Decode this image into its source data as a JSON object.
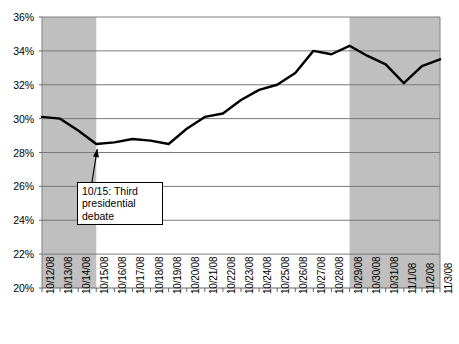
{
  "chart_data": {
    "type": "line",
    "title": "",
    "subtitle": "",
    "xlabel": "",
    "ylabel": "",
    "ylim": [
      20,
      36
    ],
    "ytick_labels": [
      "36%",
      "34%",
      "32%",
      "30%",
      "28%",
      "26%",
      "24%",
      "22%",
      "20%"
    ],
    "ytick_values": [
      36,
      34,
      32,
      30,
      28,
      26,
      24,
      22,
      20
    ],
    "grid": "horizontal",
    "legend": "none",
    "line_color": "#000000",
    "shaded_band_color": "#bfbfbf",
    "categories": [
      "10/12/08",
      "10/13/08",
      "10/14/08",
      "10/15/08",
      "10/16/08",
      "10/17/08",
      "10/18/08",
      "10/19/08",
      "10/20/08",
      "10/21/08",
      "10/22/08",
      "10/23/08",
      "10/24/08",
      "10/25/08",
      "10/26/08",
      "10/27/08",
      "10/28/08",
      "10/29/08",
      "10/30/08",
      "10/31/08",
      "11/1/08",
      "11/2/08",
      "11/3/08"
    ],
    "values": [
      30.1,
      30.0,
      29.3,
      28.5,
      28.6,
      28.8,
      28.7,
      28.5,
      29.4,
      30.1,
      30.3,
      31.1,
      31.7,
      32.0,
      32.7,
      34.0,
      33.8,
      34.3,
      33.7,
      33.2,
      32.1,
      33.1,
      33.5
    ],
    "shaded_regions": [
      {
        "from": "10/12/08",
        "to": "10/15/08",
        "label": "shaded-band-left"
      },
      {
        "from": "10/29/08",
        "to": "11/3/08",
        "label": "shaded-band-right"
      }
    ],
    "annotations": [
      {
        "text": "10/15: Third\npresidential\ndebate",
        "points_to": "10/15/08",
        "kind": "callout-with-arrow"
      }
    ]
  }
}
